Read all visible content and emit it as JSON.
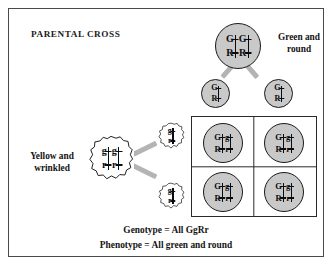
{
  "figure": {
    "title": "PARENTAL CROSS",
    "type": "punnett-square-dihybrid-cross"
  },
  "labels": {
    "green_round": "Green and\nround",
    "green_round_line1": "Green and",
    "green_round_line2": "round",
    "yellow_wrinkled_line1": "Yellow and",
    "yellow_wrinkled_line2": "wrinkled"
  },
  "parents": {
    "top": {
      "name": "green-round-parent",
      "genotype": "GGRR",
      "phenotype": "Green and round",
      "shape": "round",
      "fill": "#c9c9c9",
      "chromosomes": [
        {
          "top_allele": "G",
          "bottom_allele": "R"
        },
        {
          "top_allele": "G",
          "bottom_allele": "R"
        }
      ]
    },
    "left": {
      "name": "yellow-wrinkled-parent",
      "genotype": "ggrr",
      "phenotype": "Yellow and wrinkled",
      "shape": "wrinkled",
      "fill": "#ffffff",
      "chromosomes": [
        {
          "top_allele": "g",
          "bottom_allele": "r"
        },
        {
          "top_allele": "g",
          "bottom_allele": "r"
        }
      ]
    }
  },
  "gametes": {
    "top": [
      {
        "name": "gamete-GR-left",
        "genotype": "GR",
        "shape": "round",
        "top_allele": "G",
        "bottom_allele": "R"
      },
      {
        "name": "gamete-GR-right",
        "genotype": "GR",
        "shape": "round",
        "top_allele": "G",
        "bottom_allele": "R"
      }
    ],
    "left": [
      {
        "name": "gamete-gr-upper",
        "genotype": "gr",
        "shape": "wrinkled",
        "top_allele": "g",
        "bottom_allele": "r"
      },
      {
        "name": "gamete-gr-lower",
        "genotype": "gr",
        "shape": "wrinkled",
        "top_allele": "g",
        "bottom_allele": "r"
      }
    ]
  },
  "offspring": [
    {
      "name": "offspring-cell-1",
      "position": "top-left",
      "genotype": "GgRr",
      "shape": "round",
      "fill": "#c9c9c9",
      "chromosomes": [
        {
          "top_allele": "G",
          "bottom_allele": "R"
        },
        {
          "top_allele": "g",
          "bottom_allele": "r"
        }
      ]
    },
    {
      "name": "offspring-cell-2",
      "position": "top-right",
      "genotype": "GgRr",
      "shape": "round",
      "fill": "#c9c9c9",
      "chromosomes": [
        {
          "top_allele": "G",
          "bottom_allele": "R"
        },
        {
          "top_allele": "g",
          "bottom_allele": "r"
        }
      ]
    },
    {
      "name": "offspring-cell-3",
      "position": "bottom-left",
      "genotype": "GgRr",
      "shape": "round",
      "fill": "#c9c9c9",
      "chromosomes": [
        {
          "top_allele": "G",
          "bottom_allele": "R"
        },
        {
          "top_allele": "g",
          "bottom_allele": "r"
        }
      ]
    },
    {
      "name": "offspring-cell-4",
      "position": "bottom-right",
      "genotype": "GgRr",
      "shape": "round",
      "fill": "#c9c9c9",
      "chromosomes": [
        {
          "top_allele": "G",
          "bottom_allele": "R"
        },
        {
          "top_allele": "g",
          "bottom_allele": "r"
        }
      ]
    }
  ],
  "caption": {
    "genotype": "Genotype  =  All GgRr",
    "phenotype": "Phenotype  =  All green and round"
  },
  "colors": {
    "circle_fill_dominant": "#c9c9c9",
    "circle_fill_recessive": "#ffffff",
    "outline": "#1a1a1a",
    "connector": "#b4b4b4",
    "grid_line": "#2a2a2a",
    "frame_border": "#4a4a4a",
    "text": "#141414",
    "background": "#ffffff"
  }
}
